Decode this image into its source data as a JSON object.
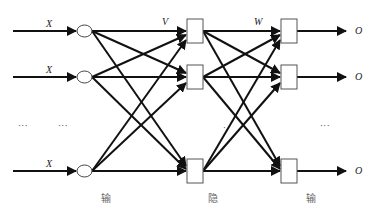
{
  "diagram": {
    "type": "neural-network",
    "rows_y": [
      31,
      77,
      171
    ],
    "inputs": [
      {
        "label": "X",
        "y": 31
      },
      {
        "label": "X",
        "y": 77
      },
      {
        "label": "X",
        "y": 171
      }
    ],
    "weight_labels": {
      "input_to_hidden": "V",
      "hidden_to_output": "W"
    },
    "outputs": [
      {
        "label": "O",
        "y": 31
      },
      {
        "label": "O",
        "y": 77
      },
      {
        "label": "O",
        "y": 171
      }
    ],
    "ellipsis": {
      "left_1": "···",
      "left_2": "···",
      "middle": "·",
      "right": "···"
    },
    "layer_labels": {
      "input": "输",
      "hidden": "隐",
      "output": "输"
    },
    "colors": {
      "line": "#111111",
      "node_stroke": "#444444",
      "text": "#222222"
    }
  }
}
